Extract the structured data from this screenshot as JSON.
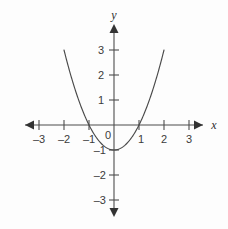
{
  "chart_data": {
    "type": "line",
    "title": "",
    "subtitle": "",
    "xlabel": "x",
    "ylabel": "y",
    "function": "y = x^2 - 1",
    "xlim": [
      -3.6,
      3.6
    ],
    "ylim": [
      -3.6,
      4.3
    ],
    "xticks": [
      -3,
      -2,
      -1,
      1,
      2,
      3
    ],
    "yticks": [
      3,
      2,
      1,
      -1,
      -2,
      -3
    ],
    "xtick_labels": [
      "–3",
      "–2",
      "–1",
      "1",
      "2",
      "3"
    ],
    "ytick_labels": [
      "3",
      "2",
      "1",
      "–1",
      "–2",
      "–3"
    ],
    "origin_label": "0",
    "grid": false,
    "legend": null,
    "axis_arrows": true,
    "vertex": [
      0,
      -1
    ],
    "roots": [
      -1,
      1
    ],
    "y_intercept": -1,
    "series": [
      {
        "name": "y = x^2 - 1",
        "color": "#4a4a4a",
        "x": [
          -2.0,
          -1.8,
          -1.6,
          -1.4,
          -1.2,
          -1.0,
          -0.8,
          -0.6,
          -0.4,
          -0.2,
          0.0,
          0.2,
          0.4,
          0.6,
          0.8,
          1.0,
          1.2,
          1.4,
          1.6,
          1.8,
          2.0
        ],
        "values": [
          3.0,
          2.24,
          1.56,
          0.96,
          0.44,
          0.0,
          -0.36,
          -0.64,
          -0.84,
          -0.96,
          -1.0,
          -0.96,
          -0.84,
          -0.64,
          -0.36,
          0.0,
          0.44,
          0.96,
          1.56,
          2.24,
          3.0
        ]
      }
    ]
  },
  "axes": {
    "x_label": "x",
    "y_label": "y",
    "origin": "0"
  },
  "colors": {
    "background": "#fdfdfd",
    "axis": "#4d4d4d",
    "curve": "#4a4a4a",
    "text": "#3b3b3b"
  }
}
